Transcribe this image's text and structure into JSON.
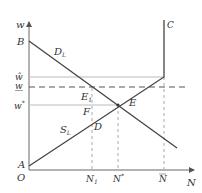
{
  "diagram": {
    "type": "labor-market-diagram",
    "axes": {
      "y_label": "w",
      "x_label": "N",
      "origin_label": "O"
    },
    "points": {
      "A": "A",
      "B": "B",
      "C": "C",
      "E": "E",
      "E1": "E",
      "E1_sub": "1",
      "F": "F",
      "D": "D"
    },
    "curves": {
      "demand": {
        "label": "D",
        "subscript": "L"
      },
      "supply": {
        "label": "S",
        "subscript": "L"
      }
    },
    "y_ticks": {
      "w_hat": "ŵ",
      "w_under": "w",
      "w_star": "w",
      "w_star_sup": "*"
    },
    "x_ticks": {
      "N1": "N",
      "N1_sub": "1",
      "N_star": "N",
      "N_star_sup": "*",
      "N_bar": "N"
    },
    "colors": {
      "axis": "#555555",
      "curve": "#444444",
      "guide": "#999999",
      "dashed": "#555555"
    }
  }
}
